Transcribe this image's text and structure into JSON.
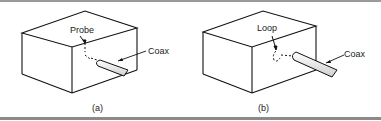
{
  "figure": {
    "panels": [
      {
        "id": "a",
        "caption": "(a)",
        "element_label": "Probe",
        "cable_label": "Coax"
      },
      {
        "id": "b",
        "caption": "(b)",
        "element_label": "Loop",
        "cable_label": "Coax"
      }
    ]
  }
}
